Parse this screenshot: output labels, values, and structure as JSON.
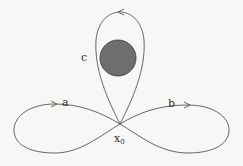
{
  "diagram": {
    "type": "loop-space",
    "colors": {
      "line": "#555555",
      "obstacle_fill": "#6e6e6e",
      "obstacle_stroke": "#444444",
      "background": "#f7f7f5"
    },
    "base_point": {
      "label": "x",
      "subscript": "0"
    },
    "loops": [
      {
        "label": "a",
        "position": "left",
        "direction": "clockwise"
      },
      {
        "label": "b",
        "position": "right",
        "direction": "counterclockwise"
      },
      {
        "label": "c",
        "position": "top",
        "direction": "counterclockwise",
        "encloses_obstacle": true
      }
    ],
    "obstacle": {
      "shape": "filled-circle"
    }
  }
}
